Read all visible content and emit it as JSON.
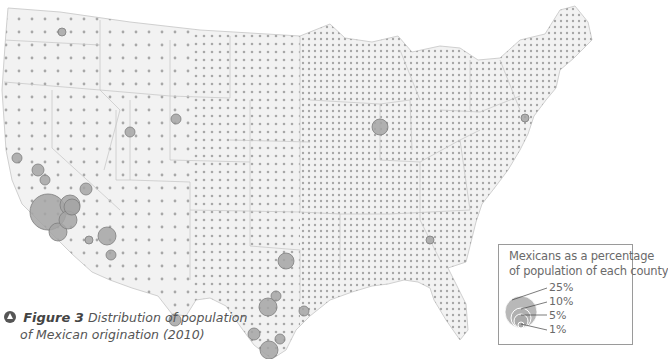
{
  "figure": {
    "label": "Figure 3",
    "title_line1": "Distribution of population",
    "title_line2": "of Mexican origination (2010)"
  },
  "legend": {
    "title_line1": "Mexicans as a percentage",
    "title_line2": "of population of each county",
    "levels": [
      {
        "label": "25%",
        "value": 25
      },
      {
        "label": "10%",
        "value": 10
      },
      {
        "label": "5%",
        "value": 5
      },
      {
        "label": "1%",
        "value": 1
      }
    ]
  },
  "map": {
    "type": "proportional-symbol",
    "region": "Contiguous United States, county level",
    "symbol_fill": "#9a9a9a",
    "symbol_stroke": "#7a7a7a",
    "land_fill": "#f1f1f1",
    "border_color": "#cfcfcf",
    "hotspots": [
      {
        "name": "Los Angeles area",
        "x": 48,
        "y": 212,
        "r": 18
      },
      {
        "name": "Southern California",
        "x": 70,
        "y": 205,
        "r": 10
      },
      {
        "name": "San Diego",
        "x": 58,
        "y": 232,
        "r": 9
      },
      {
        "name": "Imperial",
        "x": 68,
        "y": 220,
        "r": 9
      },
      {
        "name": "Inland Empire",
        "x": 72,
        "y": 207,
        "r": 8
      },
      {
        "name": "Arizona Maricopa",
        "x": 107,
        "y": 236,
        "r": 9
      },
      {
        "name": "Yuma",
        "x": 89,
        "y": 240,
        "r": 4
      },
      {
        "name": "Pima",
        "x": 111,
        "y": 255,
        "r": 5
      },
      {
        "name": "Las Vegas",
        "x": 86,
        "y": 189,
        "r": 6
      },
      {
        "name": "Central Valley",
        "x": 38,
        "y": 170,
        "r": 6
      },
      {
        "name": "Fresno",
        "x": 45,
        "y": 180,
        "r": 5
      },
      {
        "name": "Bay Area",
        "x": 17,
        "y": 158,
        "r": 5
      },
      {
        "name": "Chicago",
        "x": 380,
        "y": 127,
        "r": 8
      },
      {
        "name": "Dallas-Fort Worth",
        "x": 286,
        "y": 261,
        "r": 8
      },
      {
        "name": "San Antonio",
        "x": 268,
        "y": 307,
        "r": 9
      },
      {
        "name": "Austin",
        "x": 276,
        "y": 296,
        "r": 5
      },
      {
        "name": "Houston",
        "x": 304,
        "y": 311,
        "r": 5
      },
      {
        "name": "Rio Grande Valley",
        "x": 269,
        "y": 350,
        "r": 9
      },
      {
        "name": "El Paso",
        "x": 175,
        "y": 320,
        "r": 6
      },
      {
        "name": "Denver",
        "x": 176,
        "y": 119,
        "r": 5
      },
      {
        "name": "Salt Lake",
        "x": 130,
        "y": 132,
        "r": 5
      },
      {
        "name": "Atlanta",
        "x": 430,
        "y": 240,
        "r": 4
      },
      {
        "name": "New York",
        "x": 525,
        "y": 118,
        "r": 4
      },
      {
        "name": "Yakima",
        "x": 62,
        "y": 32,
        "r": 4
      },
      {
        "name": "Laredo",
        "x": 254,
        "y": 334,
        "r": 6
      },
      {
        "name": "Corpus Christi",
        "x": 280,
        "y": 339,
        "r": 5
      }
    ]
  }
}
